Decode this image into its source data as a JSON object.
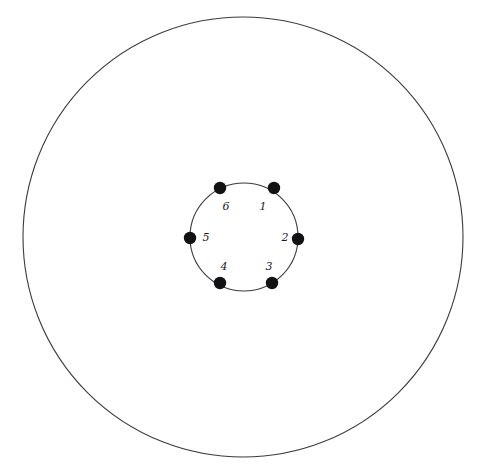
{
  "figure": {
    "background_color": "#ffffff",
    "stroke_color": "#3b3b3f",
    "dot_color": "#121214",
    "label_color": "#1b1b1f",
    "width": 487,
    "height": 472
  },
  "outer_circle": {
    "name": "outer-circle",
    "center_x": 243,
    "center_y": 237,
    "radius": 220,
    "stroke_width": 1.1,
    "filled": false
  },
  "inner_circle": {
    "name": "inner-circle",
    "center_x": 244,
    "center_y": 237,
    "radius": 54,
    "stroke_width": 1.1,
    "filled": false
  },
  "nodes": [
    {
      "label": "1",
      "angle_deg": -56,
      "dot_x": 274,
      "dot_y": 188,
      "dot_r": 6.2,
      "label_x": 263,
      "label_y": 207
    },
    {
      "label": "2",
      "angle_deg": 2,
      "dot_x": 298,
      "dot_y": 239,
      "dot_r": 6.2,
      "label_x": 285,
      "label_y": 238
    },
    {
      "label": "3",
      "angle_deg": 60,
      "dot_x": 272,
      "dot_y": 283,
      "dot_r": 6.2,
      "label_x": 269,
      "label_y": 267
    },
    {
      "label": "4",
      "angle_deg": 121,
      "dot_x": 220,
      "dot_y": 283,
      "dot_r": 6.2,
      "label_x": 224,
      "label_y": 267
    },
    {
      "label": "5",
      "angle_deg": 180,
      "dot_x": 190,
      "dot_y": 238,
      "dot_r": 6.2,
      "label_x": 206,
      "label_y": 238
    },
    {
      "label": "6",
      "angle_deg": 242,
      "dot_x": 220,
      "dot_y": 188,
      "dot_r": 6.2,
      "label_x": 226,
      "label_y": 207
    }
  ],
  "chart_data": {
    "type": "scatter",
    "xlabel": "",
    "ylabel": "",
    "xlim": [
      0,
      487
    ],
    "ylim": [
      0,
      472
    ],
    "grid": false,
    "legend": "none",
    "annotations": [
      "1",
      "2",
      "3",
      "4",
      "5",
      "6"
    ],
    "series": [
      {
        "name": "inner-circle-points",
        "x": [
          274,
          298,
          272,
          220,
          190,
          220
        ],
        "y": [
          188,
          239,
          283,
          283,
          238,
          188
        ],
        "labels": [
          "1",
          "2",
          "3",
          "4",
          "5",
          "6"
        ]
      }
    ],
    "shapes": [
      {
        "type": "circle",
        "cx": 243,
        "cy": 237,
        "r": 220,
        "fill": "none",
        "stroke": "#3b3b3f"
      },
      {
        "type": "circle",
        "cx": 244,
        "cy": 237,
        "r": 54,
        "fill": "none",
        "stroke": "#3b3b3f"
      }
    ]
  }
}
